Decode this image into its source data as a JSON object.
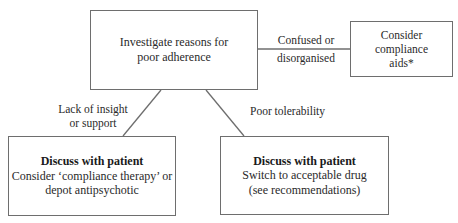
{
  "diagram": {
    "type": "flowchart",
    "nodes": {
      "main": {
        "lines": [
          "Investigate reasons for",
          "poor adherence"
        ]
      },
      "aids": {
        "lines": [
          "Consider",
          "compliance",
          "aids*"
        ]
      },
      "insight": {
        "title": "Discuss with patient",
        "lines": [
          "Consider ‘compliance therapy’ or",
          "depot antipsychotic"
        ]
      },
      "tolerability": {
        "title": "Discuss with patient",
        "lines": [
          "Switch to acceptable drug",
          "(see recommendations)"
        ]
      }
    },
    "edges": {
      "confused": {
        "from": "main",
        "to": "aids",
        "lines": [
          "Confused or",
          "disorganised"
        ]
      },
      "insight": {
        "from": "main",
        "to": "insight",
        "lines": [
          "Lack of insight",
          "or support"
        ]
      },
      "tolerability": {
        "from": "main",
        "to": "tolerability",
        "lines": [
          "Poor tolerability"
        ]
      }
    },
    "colors": {
      "border": "#6e6e6e",
      "line": "#6e6e6e",
      "text": "#2a2a2a",
      "background": "#ffffff"
    }
  }
}
